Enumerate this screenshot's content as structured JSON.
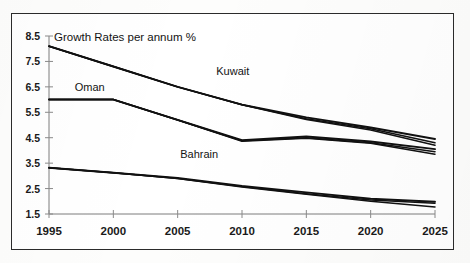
{
  "chart_data": {
    "type": "line",
    "title": "Growth Rates per annum %",
    "xlabel": "",
    "ylabel": "",
    "x": [
      1995,
      2000,
      2005,
      2010,
      2015,
      2020,
      2025
    ],
    "xlim": [
      1995,
      2025
    ],
    "ylim": [
      1.5,
      8.5
    ],
    "grid": false,
    "legend_position": "inline-labels",
    "xticklabels": [
      "1995",
      "2000",
      "2005",
      "2010",
      "2015",
      "2020",
      "2025"
    ],
    "yticklabels": [
      "1.5",
      "2.5",
      "3.5",
      "4.5",
      "5.5",
      "6.5",
      "7.5",
      "8.5"
    ],
    "yticks": [
      1.5,
      2.5,
      3.5,
      4.5,
      5.5,
      6.5,
      7.5,
      8.5
    ],
    "series": [
      {
        "name": "Kuwait",
        "label": "Kuwait",
        "values": [
          8.1,
          7.3,
          6.5,
          5.8,
          5.3,
          4.9,
          4.45
        ],
        "color": "#111111"
      },
      {
        "name": "Kuwait variant A",
        "label": "",
        "values": [
          8.1,
          7.3,
          6.5,
          5.8,
          5.25,
          4.85,
          4.3
        ],
        "color": "#111111"
      },
      {
        "name": "Kuwait variant B",
        "label": "",
        "values": [
          8.1,
          7.3,
          6.5,
          5.8,
          5.22,
          4.8,
          4.2
        ],
        "color": "#111111"
      },
      {
        "name": "Oman",
        "label": "Oman",
        "values": [
          6.0,
          6.0,
          5.2,
          4.4,
          4.55,
          4.35,
          4.05
        ],
        "color": "#111111"
      },
      {
        "name": "Oman variant A",
        "label": "",
        "values": [
          6.0,
          6.0,
          5.2,
          4.38,
          4.5,
          4.3,
          3.95
        ],
        "color": "#111111"
      },
      {
        "name": "Oman variant B",
        "label": "",
        "values": [
          6.0,
          6.0,
          5.2,
          4.36,
          4.48,
          4.28,
          3.85
        ],
        "color": "#111111"
      },
      {
        "name": "Bahrain",
        "label": "Bahrain",
        "values": [
          3.32,
          3.12,
          2.92,
          2.6,
          2.35,
          2.1,
          1.98
        ],
        "color": "#111111"
      },
      {
        "name": "Bahrain variant A",
        "label": "",
        "values": [
          3.32,
          3.12,
          2.9,
          2.58,
          2.3,
          2.05,
          1.92
        ],
        "color": "#111111"
      },
      {
        "name": "Bahrain variant B",
        "label": "",
        "values": [
          3.32,
          3.12,
          2.9,
          2.56,
          2.28,
          2.0,
          1.78
        ],
        "color": "#111111"
      }
    ],
    "annotations": [
      {
        "text": "Kuwait",
        "x": 2008.0,
        "y": 6.95
      },
      {
        "text": "Oman",
        "x": 1997.0,
        "y": 6.35
      },
      {
        "text": "Bahrain",
        "x": 2005.2,
        "y": 3.72
      }
    ]
  },
  "figure": {
    "title": "Growth Rates per annum %",
    "series_labels": {
      "kuwait": "Kuwait",
      "oman": "Oman",
      "bahrain": "Bahrain"
    },
    "y_axis": {
      "labels": [
        "8.5",
        "7.5",
        "6.5",
        "5.5",
        "4.5",
        "3.5",
        "2.5",
        "1.5"
      ]
    },
    "x_axis": {
      "labels": [
        "1995",
        "2000",
        "2005",
        "2010",
        "2015",
        "2020",
        "2025"
      ]
    }
  }
}
